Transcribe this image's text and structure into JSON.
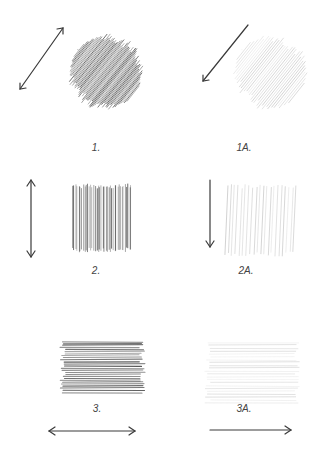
{
  "colors": {
    "arrow": "#3a3a3a",
    "dark_hatch": "#555555",
    "light_hatch": "#b8b8b8",
    "background": "#ffffff"
  },
  "panels": [
    {
      "label": "1.",
      "direction": "diagonal",
      "arrow": "double-headed",
      "tone": "dark",
      "label_pos": [
        86,
        122
      ]
    },
    {
      "label": "1A.",
      "direction": "diagonal",
      "arrow": "single-headed down-left",
      "tone": "light",
      "label_pos": [
        244,
        122
      ]
    },
    {
      "label": "2.",
      "direction": "vertical",
      "arrow": "double-headed",
      "tone": "dark",
      "label_pos": [
        96,
        263
      ]
    },
    {
      "label": "2A.",
      "direction": "vertical",
      "arrow": "single-headed down",
      "tone": "light",
      "label_pos": [
        244,
        263
      ]
    },
    {
      "label": "3.",
      "direction": "horizontal",
      "arrow": "double-headed",
      "tone": "dark",
      "label_pos": [
        96,
        402
      ]
    },
    {
      "label": "3A.",
      "direction": "horizontal",
      "arrow": "single-headed right",
      "tone": "light",
      "label_pos": [
        245,
        402
      ]
    }
  ]
}
